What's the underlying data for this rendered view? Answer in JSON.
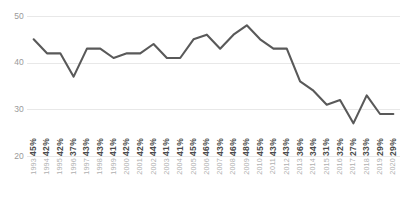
{
  "chart_data": {
    "type": "line",
    "title": "",
    "subtitle": "",
    "xlabel": "",
    "ylabel": "",
    "categories": [
      "1993",
      "1994",
      "1995",
      "1996",
      "1997",
      "1998",
      "1999",
      "2000",
      "2001",
      "2002",
      "2003",
      "2004",
      "2005",
      "2006",
      "2007",
      "2008",
      "2009",
      "2010",
      "2011",
      "2012",
      "2013",
      "2014",
      "2015",
      "2016",
      "2017",
      "2018",
      "2019",
      "2020"
    ],
    "values": [
      45,
      42,
      42,
      37,
      43,
      43,
      41,
      42,
      42,
      44,
      41,
      41,
      45,
      46,
      43,
      46,
      48,
      45,
      43,
      43,
      36,
      34,
      31,
      32,
      27,
      33,
      29,
      29
    ],
    "data_labels": [
      "45%",
      "42%",
      "42%",
      "37%",
      "43%",
      "43%",
      "41%",
      "42%",
      "42%",
      "44%",
      "41%",
      "41%",
      "45%",
      "46%",
      "43%",
      "46%",
      "48%",
      "45%",
      "43%",
      "43%",
      "36%",
      "34%",
      "31%",
      "32%",
      "27%",
      "33%",
      "29%",
      "29%"
    ],
    "ylim": [
      20,
      50
    ],
    "yticks": [
      50,
      40,
      30,
      20
    ],
    "ytick_labels": [
      "50",
      "40",
      "30",
      "20"
    ],
    "grid": true,
    "grid_axis": "y",
    "legend": false,
    "legend_position": "none",
    "series": [
      {
        "name": "",
        "values": [
          45,
          42,
          42,
          37,
          43,
          43,
          41,
          42,
          42,
          44,
          41,
          41,
          45,
          46,
          43,
          46,
          48,
          45,
          43,
          43,
          36,
          34,
          31,
          32,
          27,
          33,
          29,
          29
        ]
      }
    ]
  },
  "style": {
    "line_color": "#595959",
    "grid_color": "#e8e8e8",
    "value_label_color": "#4a4a4a",
    "year_label_color": "#b0b0b0",
    "axis_label_color": "#9a9a9a",
    "background": "#ffffff"
  }
}
